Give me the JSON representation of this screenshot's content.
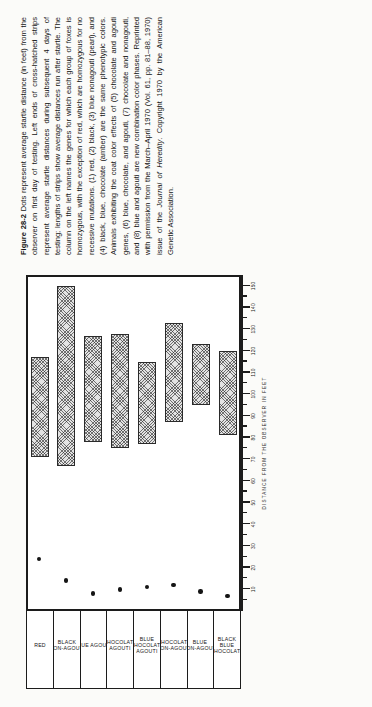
{
  "figure": {
    "number": "Figure 28-2",
    "caption_parts": {
      "p1": "Dots represent average startle distance (in feet) from the observer on first day of testing. Left ends of cross-hatched strips represent average startle distances during subsequent 4 days of testing; lengths of strips show average distances run after startle. The column on the left names the genes for which each group of foxes is homozygous, with the exception of red, which are homozygous for no recessive mutations. (1) red, (2) black, (3) blue nonagouti (pearl), and (4) black, blue, chocolate (amber) are the same phenotypic colors. Animals exhibiting the coat color effects of (5) chocolate and agouti genes, (6) blue, chocolate, and agouti, (7) chocolate and nonagouti, and (8) blue and agouti are new combination color phases. Reprinted with permission from the March–April 1970 (Vol. 61, pp. 81–88, 1970) issue of the ",
      "journal": "Journal of Heredity",
      "p2": ". Copyright 1970 by the American Genetic Association."
    }
  },
  "chart_data": {
    "type": "bar",
    "orientation": "horizontal",
    "title": "",
    "xlabel": "DISTANCE FROM THE OBSERVER IN FEET",
    "ylabel": "",
    "xlim": [
      0,
      155
    ],
    "grid": false,
    "legend": "none",
    "categories": [
      "RED",
      "BLACK\n(NON-AGOUTI)",
      "BLUE AGOUTI",
      "CHOCOLATE\nAGOUTI",
      "BLUE\nCHOCOLATE\nAGOUTI",
      "CHOCOLATE\nNON-AGOUTI",
      "BLUE\nNON-AGOUTI",
      "BLACK\nBLUE\nCHOCOLATE"
    ],
    "xticks_major": [
      10,
      20,
      30,
      40,
      50,
      60,
      70,
      80,
      90,
      100,
      110,
      120,
      130,
      140,
      150
    ],
    "xtick_labels": [
      "10",
      "20",
      "30",
      "40",
      "50",
      "60",
      "70",
      "80",
      "90",
      "100",
      "110",
      "120",
      "130",
      "140",
      "150"
    ],
    "series": [
      {
        "name": "Average startle distance and run distance (strip)",
        "type": "range-bar",
        "starts": [
          71,
          67,
          78,
          75,
          77,
          87,
          95,
          81
        ],
        "ends": [
          117,
          150,
          127,
          128,
          115,
          133,
          123,
          120
        ]
      },
      {
        "name": "First-day average startle distance (dot)",
        "type": "scatter",
        "values": [
          24,
          14,
          8,
          10,
          11,
          12,
          9,
          7
        ]
      }
    ]
  },
  "axis": {
    "title": "DISTANCE FROM THE OBSERVER IN FEET"
  }
}
